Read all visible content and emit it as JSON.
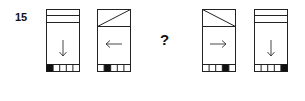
{
  "question": {
    "number": "15",
    "missing_marker": "?"
  },
  "colors": {
    "stroke": "#222222",
    "fill_black": "#111111",
    "background": "#ffffff"
  },
  "cards": [
    {
      "position": 1,
      "header": "two-horizontal-lines",
      "arrow": "down-arrow-icon",
      "arrow_glyph": "↓",
      "black_cell": 1,
      "cells": 5
    },
    {
      "position": 2,
      "header": "diagonal-bottom-left-to-top-right",
      "arrow": "left-arrow-icon",
      "arrow_glyph": "←",
      "black_cell": 2,
      "cells": 5
    },
    {
      "position": 3,
      "header": "diagonal-top-left-to-bottom-right",
      "arrow": "right-arrow-icon",
      "arrow_glyph": "→",
      "black_cell": 4,
      "cells": 5
    },
    {
      "position": 4,
      "header": "two-horizontal-lines",
      "arrow": "down-arrow-icon",
      "arrow_glyph": "↓",
      "black_cell": 5,
      "cells": 5
    }
  ]
}
